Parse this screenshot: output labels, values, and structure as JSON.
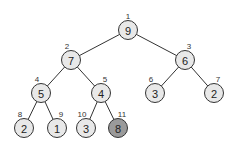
{
  "diagram": {
    "type": "binary-heap-tree",
    "colors": {
      "node_fill": "#e8e8e8",
      "highlight_fill": "#9a9a9a",
      "stroke": "#333333"
    },
    "nodes": [
      {
        "index": "1",
        "value": "9",
        "x": 128,
        "y": 30,
        "highlight": false
      },
      {
        "index": "2",
        "value": "7",
        "x": 71,
        "y": 60,
        "highlight": false
      },
      {
        "index": "3",
        "value": "6",
        "x": 185,
        "y": 60,
        "highlight": false
      },
      {
        "index": "4",
        "value": "5",
        "x": 41,
        "y": 93,
        "highlight": false
      },
      {
        "index": "5",
        "value": "4",
        "x": 101,
        "y": 93,
        "highlight": false
      },
      {
        "index": "6",
        "value": "3",
        "x": 155,
        "y": 93,
        "highlight": false
      },
      {
        "index": "7",
        "value": "2",
        "x": 214,
        "y": 93,
        "highlight": false
      },
      {
        "index": "8",
        "value": "2",
        "x": 24,
        "y": 128,
        "highlight": false
      },
      {
        "index": "9",
        "value": "1",
        "x": 57,
        "y": 128,
        "highlight": false
      },
      {
        "index": "10",
        "value": "3",
        "x": 86,
        "y": 128,
        "highlight": false
      },
      {
        "index": "11",
        "value": "8",
        "x": 118,
        "y": 128,
        "highlight": true
      }
    ],
    "edges": [
      [
        0,
        1
      ],
      [
        0,
        2
      ],
      [
        1,
        3
      ],
      [
        1,
        4
      ],
      [
        2,
        5
      ],
      [
        2,
        6
      ],
      [
        3,
        7
      ],
      [
        3,
        8
      ],
      [
        4,
        9
      ],
      [
        4,
        10
      ]
    ]
  }
}
